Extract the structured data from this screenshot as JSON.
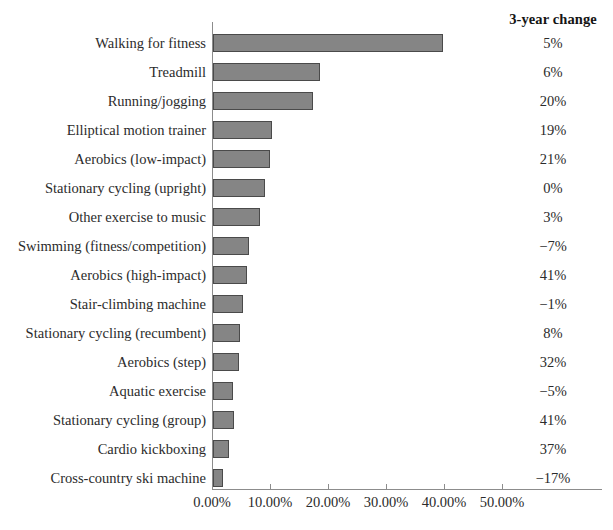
{
  "change_column": {
    "header": "3-year change"
  },
  "axis": {
    "tick_labels": [
      "0.00%",
      "10.00%",
      "20.00%",
      "30.00%",
      "40.00%",
      "50.00%"
    ]
  },
  "chart_data": {
    "type": "bar",
    "orientation": "horizontal",
    "title": "",
    "xlabel": "",
    "ylabel": "",
    "xlim": [
      0,
      57.5
    ],
    "grid": false,
    "legend": null,
    "tick_values": [
      0,
      10,
      20,
      30,
      40,
      50
    ],
    "tick_labels": [
      "0.00%",
      "10.00%",
      "20.00%",
      "30.00%",
      "40.00%",
      "50.00%"
    ],
    "bar_color": "#858585",
    "bar_edge_color": "#4a4a4a",
    "categories": [
      "Walking for fitness",
      "Treadmill",
      "Running/jogging",
      "Elliptical motion trainer",
      "Aerobics (low-impact)",
      "Stationary cycling (upright)",
      "Other exercise to music",
      "Swimming (fitness/competition)",
      "Aerobics (high-impact)",
      "Stair-climbing machine",
      "Stationary cycling (recumbent)",
      "Aerobics (step)",
      "Aquatic exercise",
      "Stationary cycling (group)",
      "Cardio kickboxing",
      "Cross-country ski machine"
    ],
    "values": [
      39.7,
      18.4,
      17.3,
      10.2,
      9.8,
      9.0,
      8.1,
      6.2,
      5.8,
      5.1,
      4.6,
      4.5,
      3.5,
      3.6,
      2.8,
      1.7
    ],
    "annotations": {
      "name": "3-year change",
      "values": [
        "5%",
        "6%",
        "20%",
        "19%",
        "21%",
        "0%",
        "3%",
        "−7%",
        "41%",
        "−1%",
        "8%",
        "32%",
        "−5%",
        "41%",
        "37%",
        "−17%"
      ]
    }
  }
}
